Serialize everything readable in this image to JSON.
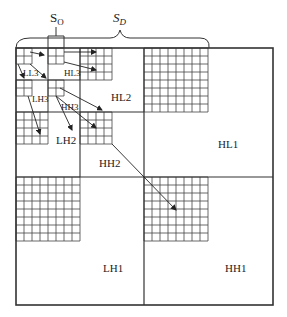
{
  "diagram": {
    "brackets": {
      "so": {
        "label_main": "S",
        "label_sub": "O"
      },
      "sd": {
        "label_main": "S",
        "label_sub": "D"
      }
    },
    "subbands": {
      "LL3": "LL3",
      "HL3": "HL3",
      "LH3": "LH3",
      "HH3": "HH3",
      "HL2": "HL2",
      "LH2": "LH2",
      "HH2": "HH2",
      "HL1": "HL1",
      "LH1": "LH1",
      "HH1": "HH1"
    },
    "colors": {
      "line": "#333333",
      "grid": "#444444",
      "background": "#ffffff"
    }
  }
}
